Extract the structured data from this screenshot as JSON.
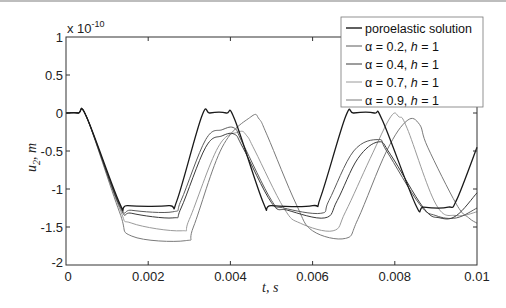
{
  "chart_data": {
    "type": "line",
    "title": "",
    "xlabel": "t, s",
    "ylabel": "u2, m",
    "y_scale_note": "x 10^-10",
    "xlim": [
      0,
      0.01
    ],
    "ylim": [
      -2,
      1
    ],
    "x_ticks": [
      "0",
      "0.002",
      "0.004",
      "0.006",
      "0.008",
      "0.01"
    ],
    "y_ticks": [
      "1",
      "0.5",
      "0",
      "-0.5",
      "-1",
      "-1.5",
      "-2"
    ],
    "grid": false,
    "legend_position": "upper right",
    "series": [
      {
        "name": "poroelastic solution",
        "color": "#1a1a1a",
        "x": [
          0,
          0.0003,
          0.0005,
          0.0013,
          0.0015,
          0.0025,
          0.0027,
          0.0033,
          0.0035,
          0.0039,
          0.0041,
          0.0048,
          0.005,
          0.006,
          0.0062,
          0.0068,
          0.007,
          0.0075,
          0.0077,
          0.0085,
          0.0087,
          0.0093,
          0.0095,
          0.01
        ],
        "values": [
          0,
          0,
          -0.05,
          -1.18,
          -1.22,
          -1.22,
          -1.15,
          -0.05,
          0,
          0,
          -0.08,
          -1.18,
          -1.22,
          -1.22,
          -1.1,
          -0.05,
          0,
          0,
          -0.1,
          -1.2,
          -1.24,
          -1.24,
          -1.15,
          -0.45
        ]
      },
      {
        "name": "α = 0.2, h = 1",
        "color": "#5a5a5a",
        "x": [
          0,
          0.0003,
          0.0005,
          0.0013,
          0.0016,
          0.0026,
          0.0028,
          0.0034,
          0.0038,
          0.0041,
          0.0043,
          0.005,
          0.0053,
          0.0062,
          0.0064,
          0.007,
          0.0076,
          0.0078,
          0.0086,
          0.009,
          0.0095,
          0.01
        ],
        "values": [
          0,
          0,
          -0.05,
          -1.2,
          -1.28,
          -1.3,
          -1.15,
          -0.35,
          -0.22,
          -0.2,
          -0.4,
          -1.15,
          -1.25,
          -1.32,
          -1.15,
          -0.5,
          -0.35,
          -0.5,
          -1.2,
          -1.35,
          -1.38,
          -1.25
        ]
      },
      {
        "name": "α = 0.4, h = 1",
        "color": "#3a3a3a",
        "x": [
          0,
          0.0003,
          0.0005,
          0.0013,
          0.0016,
          0.0026,
          0.0028,
          0.0034,
          0.0038,
          0.0041,
          0.0043,
          0.005,
          0.0054,
          0.0063,
          0.0066,
          0.0071,
          0.0076,
          0.0079,
          0.0087,
          0.0091,
          0.0095,
          0.01
        ],
        "values": [
          0,
          0,
          -0.05,
          -1.22,
          -1.32,
          -1.38,
          -1.25,
          -0.45,
          -0.3,
          -0.28,
          -0.45,
          -1.18,
          -1.28,
          -1.38,
          -1.15,
          -0.6,
          -0.38,
          -0.55,
          -1.25,
          -1.38,
          -1.35,
          -1.05
        ]
      },
      {
        "name": "α = 0.7, h = 1",
        "color": "#9a9a9a",
        "x": [
          0,
          0.0003,
          0.0005,
          0.0013,
          0.0016,
          0.0028,
          0.003,
          0.0037,
          0.0042,
          0.0044,
          0.0046,
          0.0053,
          0.0057,
          0.0065,
          0.0068,
          0.0074,
          0.0079,
          0.0081,
          0.0083,
          0.009,
          0.0095,
          0.01
        ],
        "values": [
          0,
          0,
          -0.05,
          -1.25,
          -1.45,
          -1.55,
          -1.4,
          -0.45,
          -0.25,
          -0.3,
          -0.5,
          -1.25,
          -1.45,
          -1.55,
          -1.3,
          -0.6,
          -0.05,
          -0.05,
          -0.2,
          -1.2,
          -1.35,
          -1.3
        ]
      },
      {
        "name": "α = 0.9, h = 1",
        "color": "#7a7a7a",
        "x": [
          0,
          0.0003,
          0.0005,
          0.0013,
          0.0016,
          0.0029,
          0.0031,
          0.0038,
          0.0045,
          0.0047,
          0.0049,
          0.0056,
          0.006,
          0.0068,
          0.0071,
          0.0078,
          0.0083,
          0.0086,
          0.0088,
          0.0095,
          0.0098,
          0.01
        ],
        "values": [
          0,
          0,
          -0.05,
          -1.3,
          -1.62,
          -1.68,
          -1.5,
          -0.45,
          -0.05,
          -0.08,
          -0.3,
          -1.2,
          -1.55,
          -1.65,
          -1.4,
          -0.5,
          -0.1,
          -0.15,
          -0.45,
          -1.2,
          -1.38,
          -1.45
        ]
      }
    ]
  },
  "labels": {
    "y_exponent": "x 10",
    "y_exponent_power": "-10",
    "xlabel_t": "t",
    "xlabel_rest": ", s",
    "ylabel_u": "u",
    "ylabel_sub": "2",
    "ylabel_rest": ", m"
  },
  "legend": {
    "entries": [
      {
        "label": "poroelastic solution",
        "alpha": "",
        "h": ""
      },
      {
        "prefix": "α = 0.2, ",
        "h_var": "h",
        "suffix": " = 1"
      },
      {
        "prefix": "α = 0.4, ",
        "h_var": "h",
        "suffix": " = 1"
      },
      {
        "prefix": "α = 0.7, ",
        "h_var": "h",
        "suffix": " = 1"
      },
      {
        "prefix": "α = 0.9, ",
        "h_var": "h",
        "suffix": " = 1"
      }
    ]
  }
}
